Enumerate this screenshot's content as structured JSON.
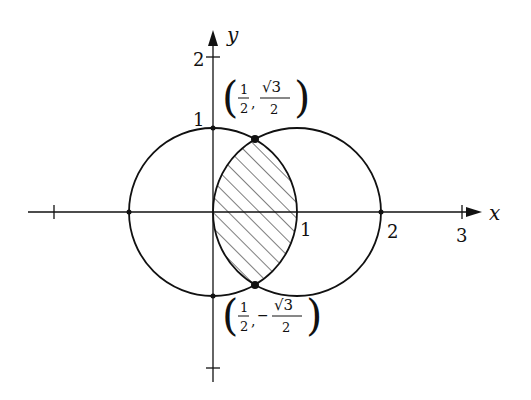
{
  "diagram": {
    "title": "",
    "axes": {
      "x_label": "x",
      "y_label": "y",
      "x_ticks": [
        "1",
        "2",
        "3"
      ],
      "y_ticks": [
        "1",
        "2"
      ]
    },
    "points": {
      "upper": {
        "x": "1",
        "x_den": "2",
        "y": "√3",
        "y_den": "2",
        "sign": ""
      },
      "lower": {
        "x": "1",
        "x_den": "2",
        "y": "√3",
        "y_den": "2",
        "sign": "−"
      }
    },
    "curves": [
      {
        "name": "circle r=1 centered at origin",
        "center": [
          0,
          0
        ],
        "radius": 1
      },
      {
        "name": "circle r=1 centered at (1,0)",
        "center": [
          1,
          0
        ],
        "radius": 1
      }
    ],
    "shaded_region": "intersection of the two circles (lens), hatched",
    "colors": {
      "ink": "#111111",
      "background": "#ffffff"
    }
  }
}
